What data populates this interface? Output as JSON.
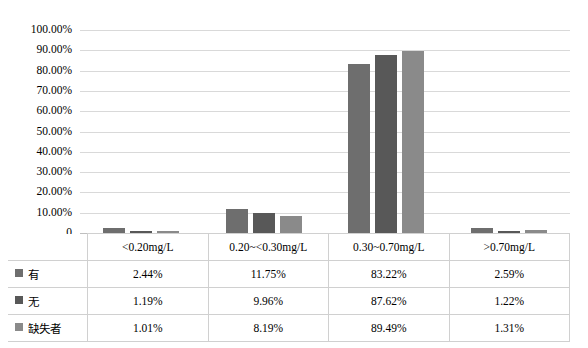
{
  "chart_data": {
    "type": "bar",
    "title": "",
    "xlabel": "",
    "ylabel": "",
    "ylim": [
      0,
      1.0
    ],
    "grid": true,
    "legend_position": "table-row-headers",
    "categories": [
      "<0.20mg/L",
      "0.20~<0.30mg/L",
      "0.30~0.70mg/L",
      ">0.70mg/L"
    ],
    "y_ticks": [
      "0",
      "10.00%",
      "20.00%",
      "30.00%",
      "40.00%",
      "50.00%",
      "60.00%",
      "70.00%",
      "80.00%",
      "90.00%",
      "100.00%"
    ],
    "y_tick_values": [
      0,
      0.1,
      0.2,
      0.3,
      0.4,
      0.5,
      0.6,
      0.7,
      0.8,
      0.9,
      1.0
    ],
    "series": [
      {
        "name": "有",
        "color": "#6e6e6e",
        "values": [
          0.0244,
          0.1175,
          0.8322,
          0.0259
        ],
        "labels": [
          "2.44%",
          "11.75%",
          "83.22%",
          "2.59%"
        ]
      },
      {
        "name": "无",
        "color": "#585858",
        "values": [
          0.0119,
          0.0996,
          0.8762,
          0.0122
        ],
        "labels": [
          "1.19%",
          "9.96%",
          "87.62%",
          "1.22%"
        ]
      },
      {
        "name": "缺失者",
        "color": "#8a8a8a",
        "values": [
          0.0101,
          0.0819,
          0.8949,
          0.0131
        ],
        "labels": [
          "1.01%",
          "8.19%",
          "89.49%",
          "1.31%"
        ]
      }
    ]
  },
  "table": {
    "corner_label": "",
    "row_header_key": "name",
    "columns": [
      "<0.20mg/L",
      "0.20~<0.30mg/L",
      "0.30~0.70mg/L",
      ">0.70mg/L"
    ],
    "rows": [
      {
        "label": "有",
        "swatch": "#6e6e6e",
        "cells": [
          "2.44%",
          "11.75%",
          "83.22%",
          "2.59%"
        ]
      },
      {
        "label": "无",
        "swatch": "#585858",
        "cells": [
          "1.19%",
          "9.96%",
          "87.62%",
          "1.22%"
        ]
      },
      {
        "label": "缺失者",
        "swatch": "#8a8a8a",
        "cells": [
          "1.01%",
          "8.19%",
          "89.49%",
          "1.31%"
        ]
      }
    ]
  },
  "colors": {
    "gridline": "#d9d9d9",
    "baseline": "#bfbfbf",
    "table_border": "#d0d0d0",
    "background": "#ffffff"
  }
}
